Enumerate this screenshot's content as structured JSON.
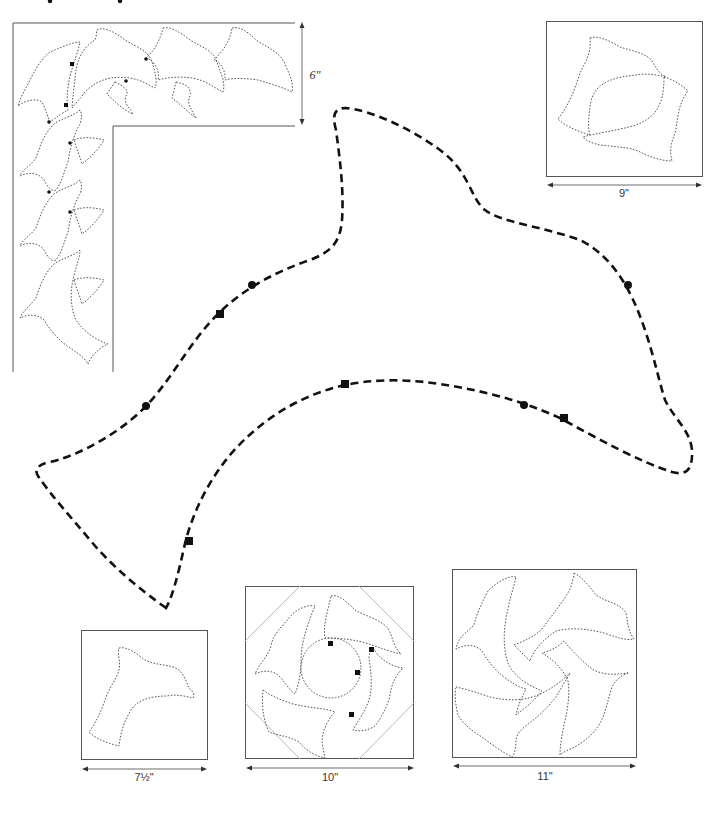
{
  "page": {
    "background": "#ffffff",
    "ink_color": "#111111"
  },
  "border_pattern": {
    "name": "corner border",
    "dimension_label": "6\"",
    "motif_count_top": 4,
    "motif_count_side": 4
  },
  "main_template": {
    "name": "full-size dolphin template",
    "markers": {
      "squares": 5,
      "circles": 4
    }
  },
  "blocks": [
    {
      "id": "block-9",
      "label": "9\"",
      "description": "two dolphins facing"
    },
    {
      "id": "block-7-5",
      "label": "7½\"",
      "description": "single dolphin"
    },
    {
      "id": "block-10",
      "label": "10\"",
      "description": "four dolphins in circle with corner guides"
    },
    {
      "id": "block-11",
      "label": "11\"",
      "description": "four dolphins pinwheel"
    }
  ]
}
